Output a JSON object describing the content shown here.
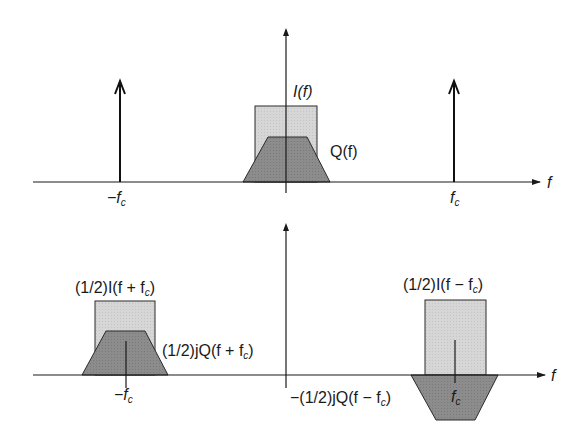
{
  "figure": {
    "top_panel": {
      "axis_label": "f",
      "labels": {
        "I": "I(f)",
        "Q": "Q(f)",
        "neg_fc": "−f",
        "pos_fc": "f",
        "subscript": "c"
      },
      "components": [
        "impulse at -fc",
        "impulse at +fc",
        "I(f) rectangle (light gray)",
        "Q(f) trapezoid (dark gray)"
      ]
    },
    "bottom_panel": {
      "axis_label": "f",
      "labels": {
        "I_plus": "(1/2)I(f + f",
        "I_plus_close": ")",
        "Q_plus": "(1/2)jQ(f + f",
        "Q_plus_close": ")",
        "I_minus": "(1/2)I(f − f",
        "I_minus_close": ")",
        "Q_minus": "−(1/2)jQ(f − f",
        "Q_minus_close": ")",
        "neg_fc": "−f",
        "pos_fc": "f",
        "subscript": "c"
      }
    },
    "colors": {
      "line": "#1a1a1a",
      "I_fill": "#d4d4d4",
      "Q_fill": "#8a8a8a"
    }
  }
}
